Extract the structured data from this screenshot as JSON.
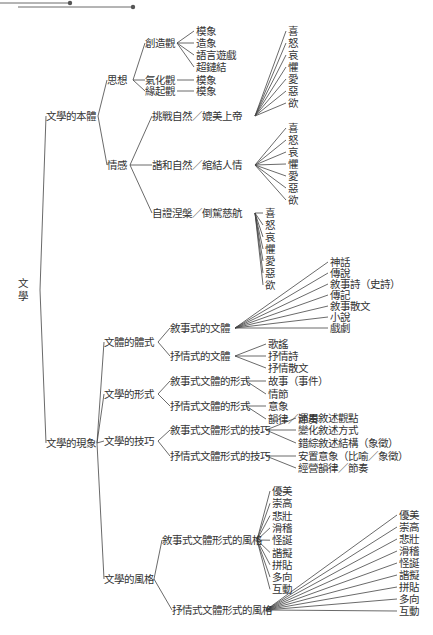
{
  "root": {
    "label": "文學",
    "chars": [
      "文",
      "學"
    ]
  },
  "branches": [
    {
      "label": "文學的本體",
      "children": [
        {
          "label": "思想",
          "children": [
            {
              "label": "創造觀",
              "children": [
                "模象",
                "造象",
                "語言遊戲",
                "超鏈結"
              ]
            },
            {
              "label": "氣化觀",
              "children": [
                "模象"
              ]
            },
            {
              "label": "緣起觀",
              "children": [
                "模象"
              ]
            }
          ]
        },
        {
          "label": "情感",
          "children": [
            {
              "label": "挑戰自然／媲美上帝",
              "children": [
                "喜",
                "怒",
                "哀",
                "懼",
                "愛",
                "惡",
                "欲"
              ]
            },
            {
              "label": "諧和自然／綰結人情",
              "children": [
                "喜",
                "怒",
                "哀",
                "懼",
                "愛",
                "惡",
                "欲"
              ]
            },
            {
              "label": "自證涅槃／倒駕慈航",
              "children": [
                "喜",
                "怒",
                "哀",
                "懼",
                "愛",
                "惡",
                "欲"
              ]
            }
          ]
        }
      ]
    },
    {
      "label": "文學的現象",
      "children": [
        {
          "label": "文體的體式",
          "children": [
            {
              "label": "敘事式的文體",
              "children": [
                "神話",
                "傳說",
                "敘事詩（史詩）",
                "傳記",
                "敘事散文",
                "小說",
                "戲劇"
              ]
            },
            {
              "label": "抒情式的文體",
              "children": [
                "歌謠",
                "抒情詩",
                "抒情散文"
              ]
            }
          ]
        },
        {
          "label": "文學的形式",
          "children": [
            {
              "label": "敘事式文體的形式",
              "children": [
                "故事（事件）",
                "情節"
              ]
            },
            {
              "label": "抒情式文體的形式",
              "children": [
                "意象",
                "韻律／節奏"
              ]
            }
          ]
        },
        {
          "label": "文學的技巧",
          "children": [
            {
              "label": "敘事式文體形式的技巧",
              "children": [
                "運用敘述觀點",
                "變化敘述方式",
                "錯綜敘述結構（象徵）"
              ]
            },
            {
              "label": "抒情式文體形式的技巧",
              "children": [
                "安置意象（比喻／象徵）",
                "經營韻律／節奏"
              ]
            }
          ]
        },
        {
          "label": "文學的風格",
          "children": [
            {
              "label": "敘事式文體形式的風格",
              "children": [
                "優美",
                "崇高",
                "悲壯",
                "滑稽",
                "怪誕",
                "諧擬",
                "拼貼",
                "多向",
                "互動"
              ]
            },
            {
              "label": "抒情式文體形式的風格",
              "children": [
                "優美",
                "崇高",
                "悲壯",
                "滑稽",
                "怪誕",
                "諧擬",
                "拼貼",
                "多向",
                "互動"
              ]
            }
          ]
        }
      ]
    }
  ],
  "colors": {
    "line": "#444444",
    "text": "#333333",
    "background": "#ffffff"
  }
}
